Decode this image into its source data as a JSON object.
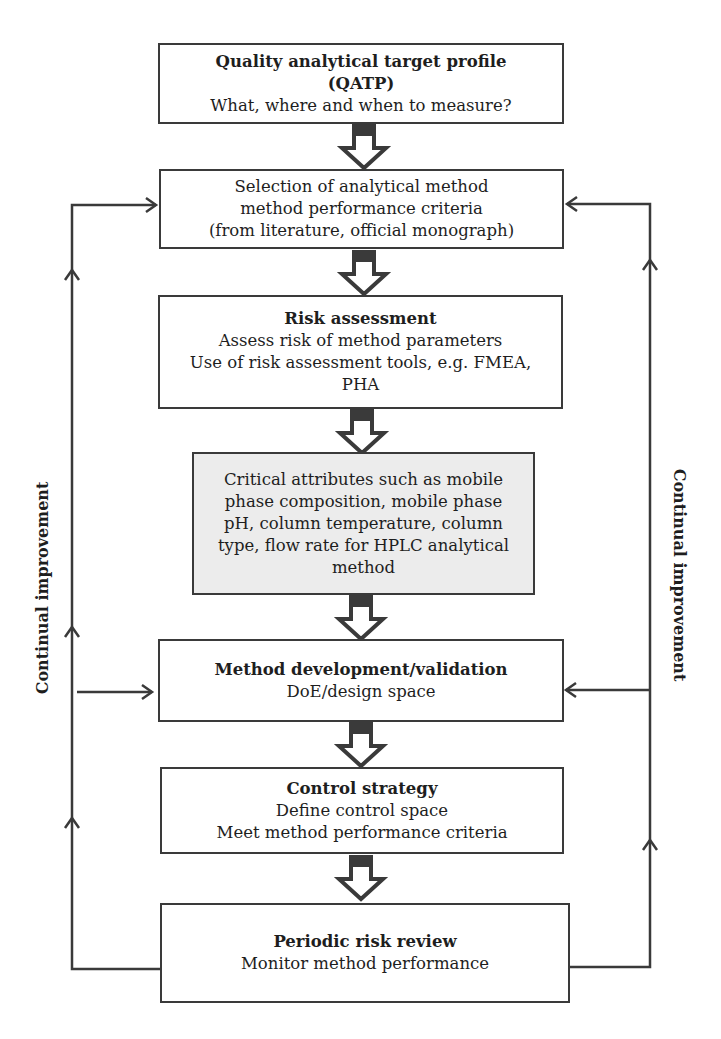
{
  "boxes": [
    {
      "id": "qatp",
      "title": "Quality analytical target profile",
      "lines": [
        "(QATP)",
        "What, where and when to measure?"
      ],
      "title_lines": 2
    },
    {
      "id": "selection",
      "title": "",
      "lines": [
        "Selection of analytical method",
        "method performance criteria",
        "(from literature, official monograph)"
      ]
    },
    {
      "id": "risk",
      "title": "Risk assessment",
      "lines": [
        "Assess risk of method parameters",
        "Use of risk assessment tools, e.g. FMEA,",
        "PHA"
      ]
    },
    {
      "id": "critical",
      "title": "",
      "lines": [
        "Critical attributes such as mobile",
        "phase composition, mobile phase",
        "pH, column temperature, column",
        "type, flow rate for HPLC analytical",
        "method"
      ]
    },
    {
      "id": "method",
      "title": "Method development/validation",
      "lines": [
        "DoE/design space"
      ]
    },
    {
      "id": "control",
      "title": "Control strategy",
      "lines": [
        "Define control space",
        "Meet method performance criteria"
      ]
    },
    {
      "id": "periodic",
      "title": "Periodic risk review",
      "lines": [
        "Monitor method performance"
      ]
    }
  ],
  "side_labels": {
    "left": "Continual improvement",
    "right": "Continual improvement"
  },
  "colors": {
    "line": "#3a3a3a",
    "highlight_box": "#ececec"
  }
}
